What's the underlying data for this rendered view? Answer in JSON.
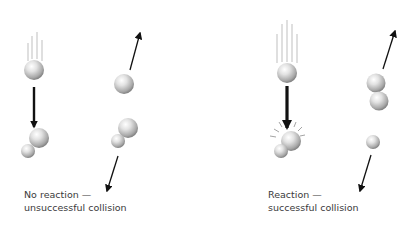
{
  "diagram": {
    "panels": [
      {
        "id": "no-reaction",
        "caption_line1": "No reaction —",
        "caption_line2": "unsuccessful collision",
        "outcome": "unsuccessful"
      },
      {
        "id": "reaction",
        "caption_line1": "Reaction —",
        "caption_line2": "successful collision",
        "outcome": "successful"
      }
    ],
    "colors": {
      "arrow": "#111111",
      "motion_lines": "#b5b5b5",
      "sphere_light": "#ffffff",
      "sphere_mid": "#c4c4c4",
      "sphere_dark": "#6e6e6e",
      "text": "#3a3a3a"
    }
  }
}
